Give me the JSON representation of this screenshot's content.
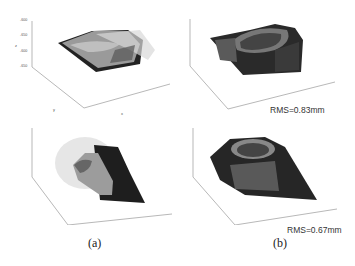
{
  "figure": {
    "captions": {
      "a": "(a)",
      "b": "(b)"
    },
    "panels": [
      {
        "id": "a-top",
        "z_ticks": [
          "-600",
          "-650",
          "-600",
          "-650"
        ],
        "y_ticks": [
          "80",
          "60",
          "40",
          "20",
          "0",
          "-20"
        ],
        "x_ticks": [
          "30",
          "40",
          "50",
          "60",
          "70",
          "80",
          "90"
        ],
        "axis_labels": {
          "x": "x",
          "y": "y",
          "z": "z"
        }
      },
      {
        "id": "b-top",
        "z_ticks": [
          "-540",
          "-560",
          "-580",
          "-600",
          "-620"
        ],
        "y_ticks": [
          "60",
          "40",
          "20",
          "0",
          "-20"
        ],
        "x_ticks": [
          "40",
          "50",
          "60",
          "70",
          "80",
          "90"
        ],
        "axis_labels": {
          "x": "x",
          "y": "y",
          "z": "z"
        },
        "annotation": "RMS=0.83mm"
      },
      {
        "id": "a-bottom",
        "z_ticks": [
          "-480",
          "-500",
          "-520",
          "-540"
        ],
        "y_ticks": [
          "40",
          "20",
          "0",
          "-20",
          "-40"
        ],
        "x_ticks": [
          "-20",
          "0",
          "20",
          "40",
          "60",
          "80"
        ],
        "axis_labels": {
          "x": "x",
          "y": "y",
          "z": "z"
        }
      },
      {
        "id": "b-bottom",
        "z_ticks": [
          "-600",
          "-610",
          "-620",
          "-630",
          "-640"
        ],
        "y_ticks": [
          "40",
          "20",
          "0",
          "-20",
          "-40"
        ],
        "x_ticks": [
          "10",
          "20",
          "30",
          "40",
          "50",
          "60",
          "70"
        ],
        "axis_labels": {
          "x": "x",
          "y": "y",
          "z": "z"
        },
        "annotation": "RMS=0.67mm"
      }
    ]
  }
}
